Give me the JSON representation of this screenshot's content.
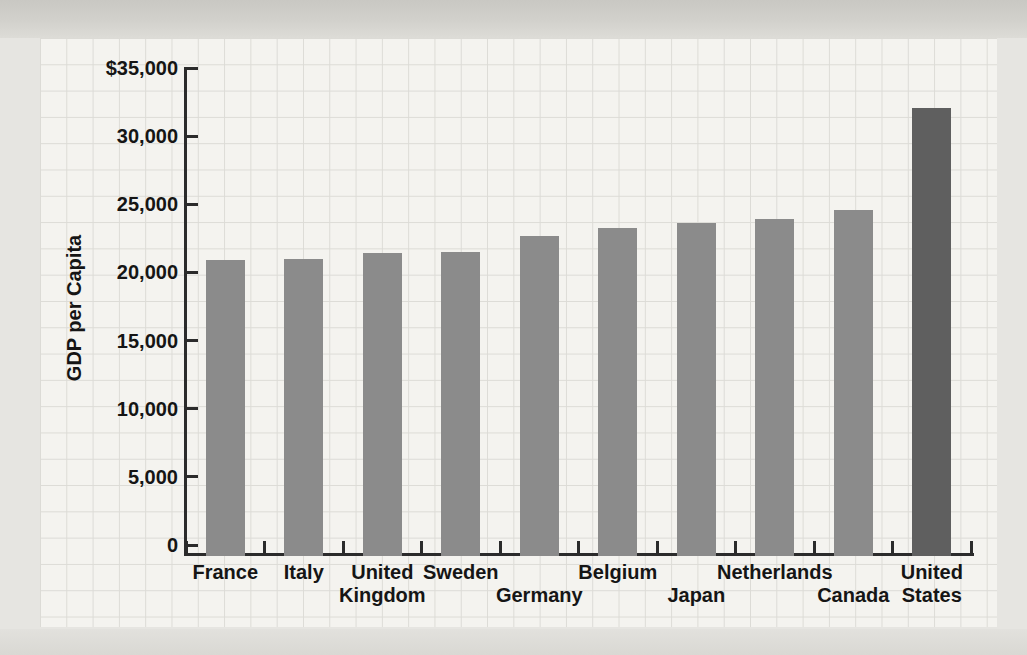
{
  "figure": {
    "kind": "scanned textbook bar chart",
    "background_outer": "#e6e5e1",
    "paper_color": "#f4f3ef",
    "grid_line_color": "#dcdbd6",
    "axis_color": "#2b2b2b",
    "text_color": "#151515"
  },
  "chart_data": {
    "type": "bar",
    "title": "",
    "xlabel": "",
    "ylabel": "GDP per Capita",
    "ylim": [
      0,
      35000
    ],
    "ytick_interval": 5000,
    "grid": "graph-paper background grid (not aligned to ticks)",
    "legend": "none",
    "yticks": [
      {
        "label": "$35,000",
        "value": 35000
      },
      {
        "label": "30,000",
        "value": 30000
      },
      {
        "label": "25,000",
        "value": 25000
      },
      {
        "label": "20,000",
        "value": 20000
      },
      {
        "label": "15,000",
        "value": 15000
      },
      {
        "label": "10,000",
        "value": 10000
      },
      {
        "label": "5,000",
        "value": 5000
      },
      {
        "label": "0",
        "value": 0
      }
    ],
    "categories": [
      "France",
      "Italy",
      "United Kingdom",
      "Sweden",
      "Germany",
      "Belgium",
      "Japan",
      "Netherlands",
      "Canada",
      "United States"
    ],
    "values": [
      20900,
      21000,
      21400,
      21500,
      22700,
      23300,
      23600,
      23900,
      24600,
      32100
    ],
    "bar_color": "#8b8b8b",
    "highlight_bar": {
      "category": "United States",
      "color": "#5f5f5f"
    },
    "category_label_lines": [
      [
        {
          "text": "France",
          "row": 1
        }
      ],
      [
        {
          "text": "Italy",
          "row": 1
        }
      ],
      [
        {
          "text": "United",
          "row": 1
        },
        {
          "text": "Kingdom",
          "row": 2
        }
      ],
      [
        {
          "text": "Sweden",
          "row": 1
        }
      ],
      [
        {
          "text": "Germany",
          "row": 2
        }
      ],
      [
        {
          "text": "Belgium",
          "row": 1
        }
      ],
      [
        {
          "text": "Japan",
          "row": 2
        }
      ],
      [
        {
          "text": "Netherlands",
          "row": 1
        }
      ],
      [
        {
          "text": "Canada",
          "row": 2
        }
      ],
      [
        {
          "text": "United",
          "row": 1
        },
        {
          "text": "States",
          "row": 2
        }
      ]
    ]
  }
}
